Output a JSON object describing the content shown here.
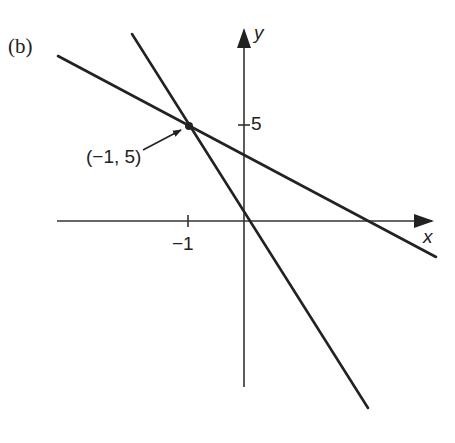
{
  "figure": {
    "panel_label": "(b)",
    "axes": {
      "x_label": "x",
      "y_label": "y",
      "x_tick_label": "−1",
      "y_tick_label": "5"
    },
    "annotation": {
      "text": "(−1, 5)",
      "point": {
        "x": -1,
        "y": 5
      }
    },
    "lines": [
      {
        "name": "steep-line",
        "description": "line through (-1,5) with steep negative slope, crossing near origin"
      },
      {
        "name": "shallow-line",
        "description": "line through (-1,5) with shallow negative slope"
      }
    ],
    "colors": {
      "ink": "#222222",
      "background": "#ffffff"
    }
  }
}
